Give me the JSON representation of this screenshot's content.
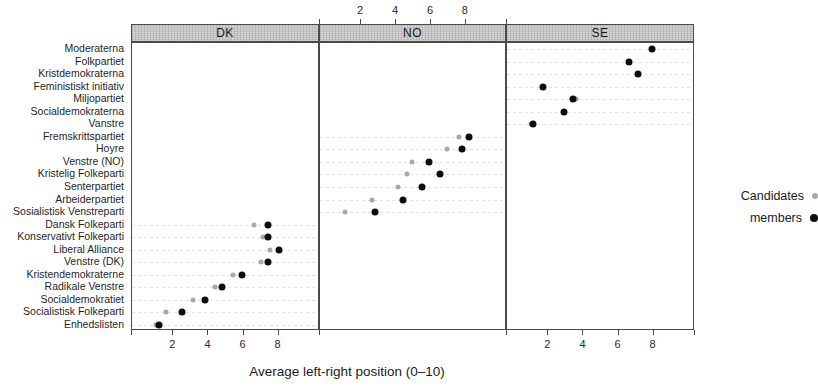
{
  "chart_data": {
    "type": "scatter",
    "title": "",
    "xlabel": "Average left-right position (0–10)",
    "ylabel": "",
    "xlim": [
      0,
      10
    ],
    "xticks": [
      2,
      4,
      6,
      8
    ],
    "xticklabels": [
      "2",
      "4",
      "6",
      "8"
    ],
    "grid": true,
    "legend_position": "right",
    "panel_label": "country",
    "panels": [
      {
        "key": "DK",
        "label": "DK",
        "axis_side": "bottom"
      },
      {
        "key": "NO",
        "label": "NO",
        "axis_side": "top"
      },
      {
        "key": "SE",
        "label": "SE",
        "axis_side": "bottom"
      }
    ],
    "series": [
      {
        "name": "Candidates",
        "marker": "dot",
        "color": "#a8a8a8",
        "size": "small"
      },
      {
        "name": "members",
        "marker": "dot",
        "color": "#0d0d0d",
        "size": "large"
      }
    ],
    "categories": [
      "Moderaterna",
      "Folkpartiet",
      "Kristdemokraterna",
      "Feministiskt initiativ",
      "Miljopartiet",
      "Socialdemokraterna",
      "Vanstre",
      "Fremskrittspartiet",
      "Hoyre",
      "Venstre (NO)",
      "Kristelig Folkeparti",
      "Senterpartiet",
      "Arbeiderpartiet",
      "Sosialistisk Venstreparti",
      "Dansk Folkeparti",
      "Konservativt Folkeparti",
      "Liberal Alliance",
      "Venstre (DK)",
      "Kristendemokraterne",
      "Radikale Venstre",
      "Socialdemokratiet",
      "Socialistisk Folkeparti",
      "Enhedslisten"
    ],
    "points": [
      {
        "party": "Moderaterna",
        "panel": "SE",
        "candidates": 7.9,
        "members": 7.9
      },
      {
        "party": "Folkpartiet",
        "panel": "SE",
        "candidates": 6.6,
        "members": 6.6
      },
      {
        "party": "Kristdemokraterna",
        "panel": "SE",
        "candidates": 7.1,
        "members": 7.1
      },
      {
        "party": "Feministiskt initiativ",
        "panel": "SE",
        "candidates": 1.7,
        "members": 1.7
      },
      {
        "party": "Miljopartiet",
        "panel": "SE",
        "candidates": 3.6,
        "members": 3.4
      },
      {
        "party": "Socialdemokraterna",
        "panel": "SE",
        "candidates": 2.9,
        "members": 2.9
      },
      {
        "party": "Vanstre",
        "panel": "SE",
        "candidates": 1.0,
        "members": 1.1
      },
      {
        "party": "Fremskrittspartiet",
        "panel": "NO",
        "candidates": 7.6,
        "members": 8.2
      },
      {
        "party": "Hoyre",
        "panel": "NO",
        "candidates": 6.9,
        "members": 7.8
      },
      {
        "party": "Venstre (NO)",
        "panel": "NO",
        "candidates": 4.9,
        "members": 5.9
      },
      {
        "party": "Kristelig Folkeparti",
        "panel": "NO",
        "candidates": 4.6,
        "members": 6.5
      },
      {
        "party": "Senterpartiet",
        "panel": "NO",
        "candidates": 4.1,
        "members": 5.5
      },
      {
        "party": "Arbeiderpartiet",
        "panel": "NO",
        "candidates": 2.6,
        "members": 4.4
      },
      {
        "party": "Sosialistisk Venstreparti",
        "panel": "NO",
        "candidates": 1.1,
        "members": 2.8
      },
      {
        "party": "Dansk Folkeparti",
        "panel": "DK",
        "candidates": 6.6,
        "members": 7.4
      },
      {
        "party": "Konservativt Folkeparti",
        "panel": "DK",
        "candidates": 7.1,
        "members": 7.4
      },
      {
        "party": "Liberal Alliance",
        "panel": "DK",
        "candidates": 7.5,
        "members": 8.0
      },
      {
        "party": "Venstre (DK)",
        "panel": "DK",
        "candidates": 7.0,
        "members": 7.4
      },
      {
        "party": "Kristendemokraterne",
        "panel": "DK",
        "candidates": 5.4,
        "members": 5.9
      },
      {
        "party": "Radikale Venstre",
        "panel": "DK",
        "candidates": 4.4,
        "members": 4.8
      },
      {
        "party": "Socialdemokratiet",
        "panel": "DK",
        "candidates": 3.1,
        "members": 3.8
      },
      {
        "party": "Socialistisk Folkeparti",
        "panel": "DK",
        "candidates": 1.6,
        "members": 2.5
      },
      {
        "party": "Enhedslisten",
        "panel": "DK",
        "candidates": 1.0,
        "members": 1.2
      }
    ]
  },
  "legend": {
    "items": [
      {
        "label": "Candidates",
        "series": "Candidates"
      },
      {
        "label": "members",
        "series": "members"
      }
    ]
  },
  "colors": {
    "candidates": "#a8a8a8",
    "members": "#0d0d0d",
    "strip_fill": "#b9b9b9",
    "panel_border": "#4a4a4a",
    "gridline": "#e2e2e2"
  }
}
